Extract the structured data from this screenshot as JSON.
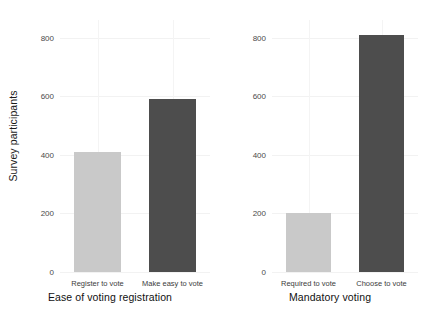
{
  "chart_data": {
    "type": "bar",
    "title": "",
    "ylabel": "Survey participants",
    "grid": "light horizontal and vertical gridlines",
    "legend": "none",
    "ylim": [
      0,
      860
    ],
    "panels": [
      {
        "xlabel": "Ease of voting registration",
        "categories": [
          "Register to vote",
          "Make easy to vote"
        ],
        "values": [
          408,
          592
        ],
        "colors": [
          "#c9c9c9",
          "#4d4d4d"
        ],
        "yticks": [
          0,
          200,
          400,
          600,
          800
        ],
        "ytick_labels": [
          "0",
          "200",
          "400",
          "600",
          "800"
        ]
      },
      {
        "xlabel": "Mandatory voting",
        "categories": [
          "Required to vote",
          "Choose to vote"
        ],
        "values": [
          200,
          810
        ],
        "colors": [
          "#c9c9c9",
          "#4d4d4d"
        ],
        "yticks": [
          0,
          200,
          400,
          600,
          800
        ],
        "ytick_labels": [
          "0",
          "200",
          "400",
          "600",
          "800"
        ]
      }
    ]
  },
  "axis": {
    "ylabel": "Survey participants"
  },
  "panel_left": {
    "xlabel": "Ease of voting registration",
    "tick0": "0",
    "tick1": "200",
    "tick2": "400",
    "tick3": "600",
    "tick4": "800",
    "cat0": "Register to vote",
    "cat1": "Make easy to vote"
  },
  "panel_right": {
    "xlabel": "Mandatory voting",
    "tick0": "0",
    "tick1": "200",
    "tick2": "400",
    "tick3": "600",
    "tick4": "800",
    "cat0": "Required to vote",
    "cat1": "Choose to vote"
  }
}
